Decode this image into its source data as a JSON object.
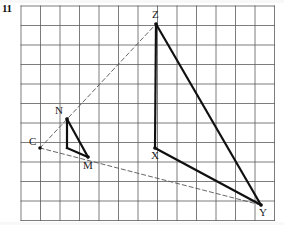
{
  "question": {
    "number": "11"
  },
  "figure": {
    "canvas": {
      "width": 284,
      "height": 225
    },
    "grid": {
      "origin_x": 21,
      "origin_y": 6,
      "cell": 19.5,
      "cols": 13,
      "rows": 11,
      "color": "#5c5c5c",
      "line_width": 0.8
    },
    "points": [
      {
        "name": "C",
        "x": 40,
        "y": 148,
        "label": "C",
        "label_dx": -11,
        "label_dy": -12,
        "role": "centre-of-enlargement"
      },
      {
        "name": "N",
        "x": 67,
        "y": 119,
        "label": "N",
        "label_dx": -12,
        "label_dy": -14,
        "role": "small-triangle-vertex"
      },
      {
        "name": "M",
        "x": 88,
        "y": 157,
        "label": "M",
        "label_dx": -5,
        "label_dy": 3,
        "role": "small-triangle-vertex"
      },
      {
        "name": "P",
        "x": 67,
        "y": 148,
        "label": "",
        "label_dx": 0,
        "label_dy": 0,
        "role": "small-triangle-vertex"
      },
      {
        "name": "Z",
        "x": 156,
        "y": 24,
        "label": "Z",
        "label_dx": -4,
        "label_dy": -15,
        "role": "large-triangle-vertex"
      },
      {
        "name": "X",
        "x": 155,
        "y": 148,
        "label": "X",
        "label_dx": -4,
        "label_dy": 2,
        "role": "large-triangle-vertex"
      },
      {
        "name": "Y",
        "x": 261,
        "y": 205,
        "label": "Y",
        "label_dx": -2,
        "label_dy": 2,
        "role": "large-triangle-vertex"
      }
    ],
    "solid_edges": [
      {
        "name": "edge-N-P",
        "from": "N",
        "to": "P"
      },
      {
        "name": "edge-N-M",
        "from": "N",
        "to": "M"
      },
      {
        "name": "edge-P-M",
        "from": "P",
        "to": "M"
      },
      {
        "name": "edge-Z-X",
        "from": "Z",
        "to": "X"
      },
      {
        "name": "edge-Z-Y",
        "from": "Z",
        "to": "Y"
      },
      {
        "name": "edge-X-Y",
        "from": "X",
        "to": "Y"
      }
    ],
    "dashed_rays": [
      {
        "name": "ray-C-Z",
        "from": "C",
        "through": "N",
        "to": "Z"
      },
      {
        "name": "ray-C-Y",
        "from": "C",
        "through": "M",
        "to": "Y"
      }
    ],
    "style": {
      "solid_color": "#101010",
      "solid_width": 2.2,
      "dashed_color": "#555555",
      "dashed_width": 0.9,
      "dash_pattern": "4 3",
      "vertex_dot_radius": 1.8
    }
  }
}
